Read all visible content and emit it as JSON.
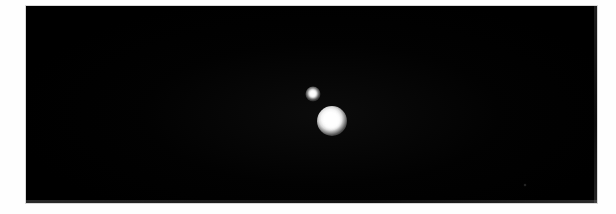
{
  "image": {
    "type": "astronomical-photograph",
    "width": 616,
    "height": 214,
    "alt_text": "",
    "background_color": "#000000",
    "margin_color": "#fefefe",
    "frame": {
      "left": 26,
      "top": 6,
      "width": 571,
      "height": 197
    }
  },
  "objects": [
    {
      "id": "primary",
      "name": "bright-object-primary",
      "center_x": 332,
      "center_y": 121,
      "diameter": 30,
      "core_diameter": 17,
      "relative_brightness": 1.0,
      "color": "#ffffff"
    },
    {
      "id": "secondary",
      "name": "bright-object-secondary",
      "center_x": 313,
      "center_y": 94,
      "diameter": 15,
      "core_diameter": 7,
      "relative_brightness": 0.55,
      "color": "#ffffff"
    }
  ],
  "faint_features": [
    {
      "id": "speck-1",
      "name": "faint-background-speck",
      "center_x": 525,
      "center_y": 185,
      "diameter": 3,
      "color": "#3c3c3c"
    }
  ],
  "separation": {
    "dx": -19,
    "dy": -27,
    "pixels": 33,
    "position_angle_deg": 215
  },
  "annotations": {
    "labels": [],
    "scale_bar": null,
    "caption": ""
  }
}
